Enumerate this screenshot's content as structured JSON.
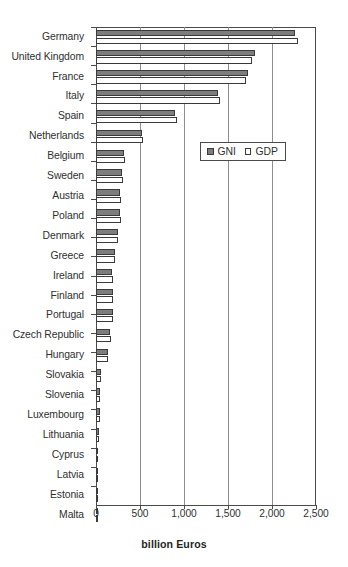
{
  "chart_data": {
    "type": "bar",
    "orientation": "horizontal",
    "title": "",
    "xlabel": "billion Euros",
    "ylabel": "",
    "xlim": [
      0,
      2500
    ],
    "xticks": [
      0,
      500,
      1000,
      1500,
      2000,
      2500
    ],
    "xtick_labels": [
      "0",
      "500",
      "1,000",
      "1,500",
      "2,000",
      "2,500"
    ],
    "grid": "vertical",
    "legend_position": "upper right inside",
    "categories": [
      "Germany",
      "United Kingdom",
      "France",
      "Italy",
      "Spain",
      "Netherlands",
      "Belgium",
      "Sweden",
      "Austria",
      "Poland",
      "Denmark",
      "Greece",
      "Ireland",
      "Finland",
      "Portugal",
      "Czech Republic",
      "Hungary",
      "Slovakia",
      "Slovenia",
      "Luxembourg",
      "Lithuania",
      "Cyprus",
      "Latvia",
      "Estonia",
      "Malta"
    ],
    "series": [
      {
        "name": "GNI",
        "color": "#7d7d7d",
        "values": [
          2265,
          1810,
          1730,
          1390,
          900,
          520,
          315,
          300,
          275,
          270,
          250,
          215,
          180,
          190,
          190,
          160,
          135,
          55,
          45,
          50,
          35,
          20,
          15,
          12,
          8
        ]
      },
      {
        "name": "GDP",
        "color": "#ffffff",
        "values": [
          2290,
          1775,
          1710,
          1410,
          915,
          530,
          330,
          305,
          280,
          280,
          255,
          220,
          195,
          195,
          195,
          165,
          140,
          60,
          48,
          42,
          38,
          22,
          17,
          13,
          9
        ]
      }
    ]
  },
  "legend": {
    "items": [
      {
        "label": "GNI",
        "swatch": "filled-gray-square-icon"
      },
      {
        "label": "GDP",
        "swatch": "hollow-white-square-icon"
      }
    ]
  }
}
